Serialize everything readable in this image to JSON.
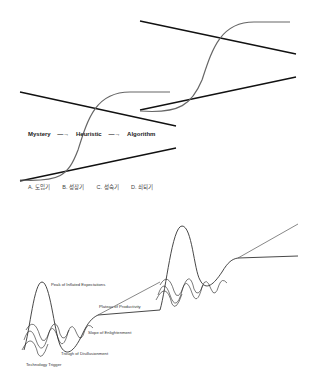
{
  "flow": {
    "steps": [
      "Mystery",
      "Heuristic",
      "Algorithm"
    ],
    "arrow": "—→"
  },
  "stages": [
    "A. 도입기",
    "B. 성장기",
    "C. 성숙기",
    "D. 쇠퇴기"
  ],
  "hype_cycle": {
    "labels": {
      "peak": "Peak of Inflated Expectations",
      "plateau": "Plateau of Productivity",
      "slope": "Slope of Enlightenment",
      "trough": "Trough of Disillusionment",
      "trigger": "Technology Trigger"
    }
  },
  "colors": {
    "line": "#111111",
    "curve": "#666666"
  }
}
